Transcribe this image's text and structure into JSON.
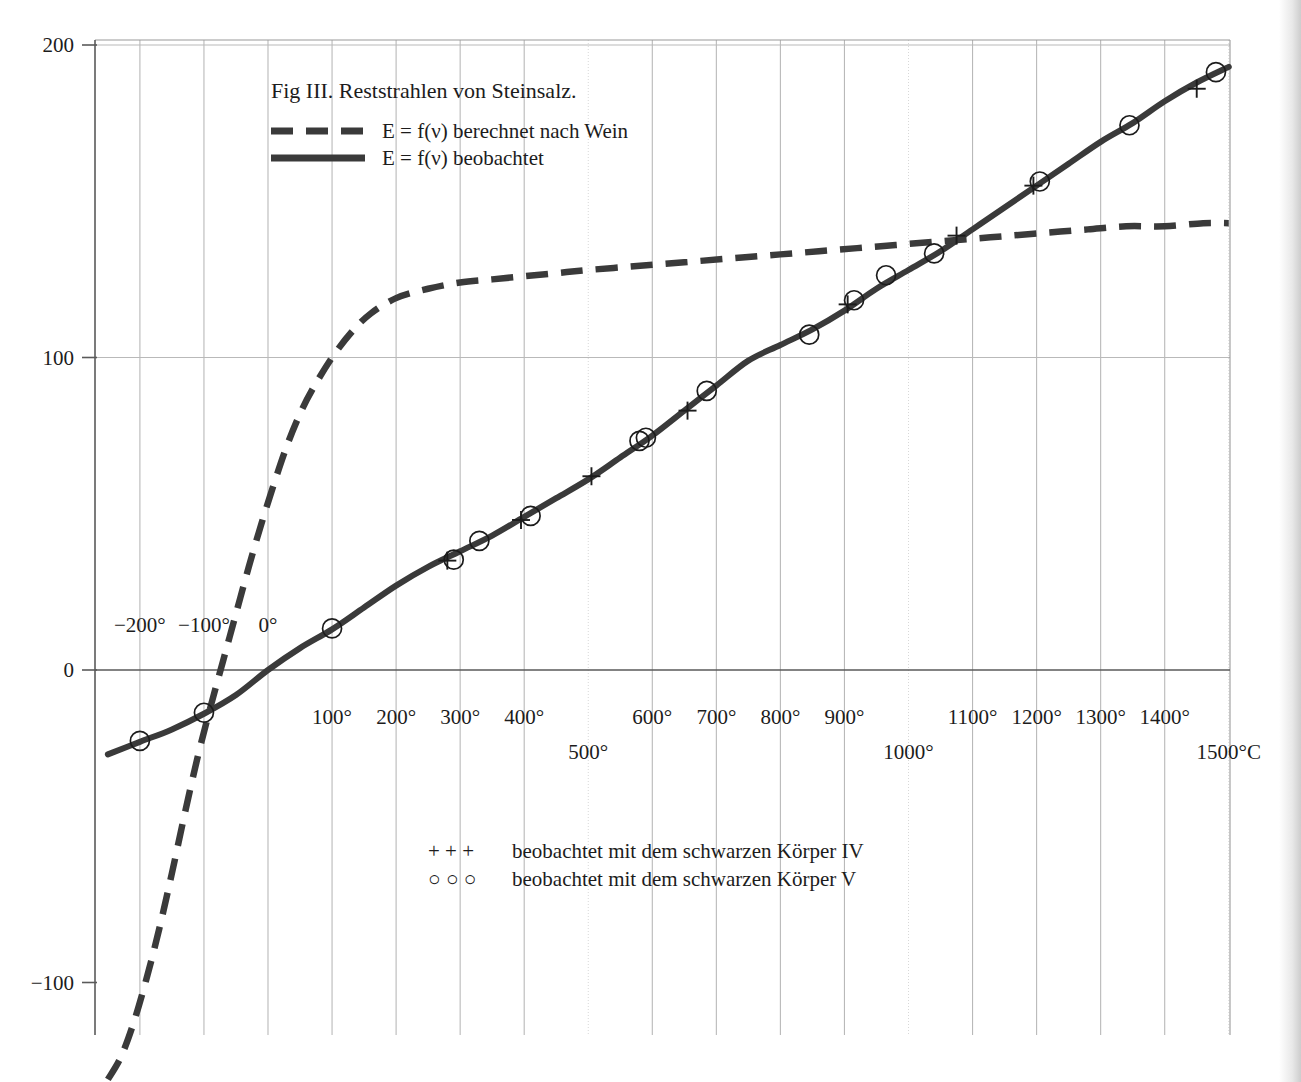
{
  "figure": {
    "title": "Fig III. Reststrahlen von Steinsalz.",
    "legend_dashed": "E = f(ν)  berechnet nach Wein",
    "legend_solid": "E = f(ν)  beobachtet",
    "marker_legend_plus": "beobachtet mit dem schwarzen Körper IV",
    "marker_legend_circle": "beobachtet mit dem schwarzen Körper V",
    "plus_symbols": "+   +   +",
    "circle_symbols": "○   ○   ○",
    "colors": {
      "curve": "#3a3a3a",
      "grid": "#b9b9b9",
      "axis": "#5a5a5a",
      "text": "#1c1c1c",
      "background": "#ffffff"
    }
  },
  "chart_data": {
    "type": "line",
    "title": "Fig III. Reststrahlen von Steinsalz.",
    "xlabel": "",
    "ylabel": "",
    "xlim": [
      -250,
      1500
    ],
    "ylim": [
      -135,
      200
    ],
    "grid": true,
    "legend_position": "upper-left",
    "x_unit": "°C",
    "x_ticks": [
      {
        "value": -200,
        "label": "−200°",
        "row": "above"
      },
      {
        "value": -100,
        "label": "−100°",
        "row": "above"
      },
      {
        "value": 0,
        "label": "0°",
        "row": "above"
      },
      {
        "value": 100,
        "label": "100°",
        "row": "below"
      },
      {
        "value": 200,
        "label": "200°",
        "row": "below"
      },
      {
        "value": 300,
        "label": "300°",
        "row": "below"
      },
      {
        "value": 400,
        "label": "400°",
        "row": "below"
      },
      {
        "value": 500,
        "label": "500°",
        "row": "below2"
      },
      {
        "value": 600,
        "label": "600°",
        "row": "below"
      },
      {
        "value": 700,
        "label": "700°",
        "row": "below"
      },
      {
        "value": 800,
        "label": "800°",
        "row": "below"
      },
      {
        "value": 900,
        "label": "900°",
        "row": "below"
      },
      {
        "value": 1000,
        "label": "1000°",
        "row": "below2"
      },
      {
        "value": 1100,
        "label": "1100°",
        "row": "below"
      },
      {
        "value": 1200,
        "label": "1200°",
        "row": "below"
      },
      {
        "value": 1300,
        "label": "1300°",
        "row": "below"
      },
      {
        "value": 1400,
        "label": "1400°",
        "row": "below"
      },
      {
        "value": 1500,
        "label": "1500°C",
        "row": "below2"
      }
    ],
    "y_ticks": [
      {
        "value": 200,
        "label": "200"
      },
      {
        "value": 100,
        "label": "100"
      },
      {
        "value": 0,
        "label": "0"
      },
      {
        "value": -100,
        "label": "−100"
      }
    ],
    "series": [
      {
        "name": "E = f(ν)  beobachtet",
        "style": "solid",
        "points": [
          [
            -250,
            -27
          ],
          [
            -200,
            -23
          ],
          [
            -150,
            -19
          ],
          [
            -100,
            -14
          ],
          [
            -50,
            -8
          ],
          [
            0,
            0
          ],
          [
            50,
            7
          ],
          [
            100,
            13
          ],
          [
            150,
            20
          ],
          [
            200,
            27
          ],
          [
            250,
            33
          ],
          [
            300,
            38
          ],
          [
            350,
            43
          ],
          [
            400,
            49
          ],
          [
            450,
            55
          ],
          [
            500,
            61
          ],
          [
            550,
            68
          ],
          [
            600,
            75
          ],
          [
            650,
            83
          ],
          [
            700,
            91
          ],
          [
            750,
            99
          ],
          [
            800,
            104
          ],
          [
            850,
            109
          ],
          [
            900,
            115
          ],
          [
            950,
            122
          ],
          [
            1000,
            128
          ],
          [
            1050,
            134
          ],
          [
            1100,
            141
          ],
          [
            1150,
            148
          ],
          [
            1200,
            155
          ],
          [
            1250,
            162
          ],
          [
            1300,
            169
          ],
          [
            1350,
            175
          ],
          [
            1400,
            182
          ],
          [
            1450,
            188
          ],
          [
            1500,
            193
          ]
        ]
      },
      {
        "name": "E = f(ν)  berechnet nach Wein",
        "style": "dashed",
        "points": [
          [
            -250,
            -131
          ],
          [
            -230,
            -124
          ],
          [
            -210,
            -113
          ],
          [
            -190,
            -99
          ],
          [
            -170,
            -83
          ],
          [
            -150,
            -65
          ],
          [
            -130,
            -46
          ],
          [
            -110,
            -28
          ],
          [
            -90,
            -12
          ],
          [
            -70,
            3
          ],
          [
            -50,
            18
          ],
          [
            -30,
            33
          ],
          [
            -10,
            47
          ],
          [
            10,
            60
          ],
          [
            30,
            72
          ],
          [
            50,
            82
          ],
          [
            70,
            90
          ],
          [
            100,
            100
          ],
          [
            130,
            108
          ],
          [
            160,
            114
          ],
          [
            200,
            119
          ],
          [
            250,
            122
          ],
          [
            300,
            124
          ],
          [
            350,
            125
          ],
          [
            400,
            126
          ],
          [
            450,
            127
          ],
          [
            500,
            128
          ],
          [
            560,
            129
          ],
          [
            620,
            130
          ],
          [
            680,
            131
          ],
          [
            740,
            132
          ],
          [
            800,
            133
          ],
          [
            860,
            134
          ],
          [
            920,
            135
          ],
          [
            980,
            136
          ],
          [
            1040,
            137
          ],
          [
            1100,
            138
          ],
          [
            1160,
            139
          ],
          [
            1220,
            140
          ],
          [
            1280,
            141
          ],
          [
            1340,
            142
          ],
          [
            1400,
            142
          ],
          [
            1460,
            143
          ],
          [
            1500,
            143
          ]
        ]
      }
    ],
    "markers": [
      {
        "type": "circle",
        "x": -200,
        "y": -23
      },
      {
        "type": "circle",
        "x": -100,
        "y": -14
      },
      {
        "type": "circle",
        "x": 100,
        "y": 13
      },
      {
        "type": "plus",
        "x": 280,
        "y": 35
      },
      {
        "type": "circle",
        "x": 290,
        "y": 35
      },
      {
        "type": "circle",
        "x": 330,
        "y": 41
      },
      {
        "type": "plus",
        "x": 395,
        "y": 48
      },
      {
        "type": "circle",
        "x": 410,
        "y": 49
      },
      {
        "type": "plus",
        "x": 505,
        "y": 62
      },
      {
        "type": "circle",
        "x": 580,
        "y": 73
      },
      {
        "type": "circle",
        "x": 590,
        "y": 74
      },
      {
        "type": "plus",
        "x": 655,
        "y": 83
      },
      {
        "type": "circle",
        "x": 685,
        "y": 89
      },
      {
        "type": "circle",
        "x": 845,
        "y": 107
      },
      {
        "type": "plus",
        "x": 905,
        "y": 117
      },
      {
        "type": "circle",
        "x": 915,
        "y": 118
      },
      {
        "type": "circle",
        "x": 965,
        "y": 126
      },
      {
        "type": "circle",
        "x": 1040,
        "y": 133
      },
      {
        "type": "plus",
        "x": 1075,
        "y": 139
      },
      {
        "type": "plus",
        "x": 1195,
        "y": 155
      },
      {
        "type": "circle",
        "x": 1205,
        "y": 156
      },
      {
        "type": "circle",
        "x": 1345,
        "y": 174
      },
      {
        "type": "plus",
        "x": 1450,
        "y": 186
      },
      {
        "type": "circle",
        "x": 1480,
        "y": 191
      }
    ]
  }
}
